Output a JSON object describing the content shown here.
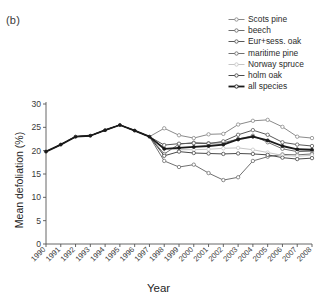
{
  "panel": {
    "label": "(b)"
  },
  "axes": {
    "xlabel": "Year",
    "ylabel": "Mean defoliation (%)"
  },
  "legend": {
    "items": [
      {
        "label": "Scots pine",
        "color": "#8a8a8a",
        "width": 1.0,
        "marker": "circle"
      },
      {
        "label": "beech",
        "color": "#6e6e6e",
        "width": 1.0,
        "marker": "circle"
      },
      {
        "label": "Eur+sess. oak",
        "color": "#595959",
        "width": 1.0,
        "marker": "circle"
      },
      {
        "label": "maritime pine",
        "color": "#707070",
        "width": 1.0,
        "marker": "circle"
      },
      {
        "label": "Norway spruce",
        "color": "#c6c6c6",
        "width": 1.0,
        "marker": "circle"
      },
      {
        "label": "holm oak",
        "color": "#4a4a4a",
        "width": 1.0,
        "marker": "circle"
      },
      {
        "label": "all species",
        "color": "#1a1a1a",
        "width": 1.8,
        "marker": "circle"
      }
    ]
  },
  "chart_data": {
    "type": "line",
    "title": "(b)",
    "xlabel": "Year",
    "ylabel": "Mean defoliation (%)",
    "xlim": [
      1990,
      2008
    ],
    "ylim": [
      0,
      30
    ],
    "yticks": [
      0,
      5,
      10,
      15,
      20,
      25,
      30
    ],
    "xticks": [
      1990,
      1991,
      1992,
      1993,
      1994,
      1995,
      1996,
      1997,
      1998,
      1999,
      2000,
      2001,
      2002,
      2003,
      2004,
      2005,
      2006,
      2007,
      2008
    ],
    "grid": false,
    "legend_position": "top-right",
    "x": [
      1990,
      1991,
      1992,
      1993,
      1994,
      1995,
      1996,
      1997,
      1998,
      1999,
      2000,
      2001,
      2002,
      2003,
      2004,
      2005,
      2006,
      2007,
      2008
    ],
    "series": [
      {
        "name": "Scots pine",
        "color": "#8a8a8a",
        "values": [
          19.8,
          21.3,
          23.0,
          23.2,
          24.4,
          25.5,
          24.3,
          23.0,
          24.8,
          23.3,
          22.7,
          23.5,
          23.6,
          25.6,
          26.4,
          26.6,
          25.1,
          23.0,
          22.7
        ]
      },
      {
        "name": "beech",
        "color": "#6e6e6e",
        "values": [
          19.8,
          21.3,
          23.0,
          23.2,
          24.4,
          25.5,
          24.3,
          23.0,
          19.3,
          21.4,
          21.7,
          21.6,
          21.7,
          22.5,
          23.2,
          21.8,
          20.4,
          19.8,
          19.9
        ]
      },
      {
        "name": "Eur+sess. oak",
        "color": "#595959",
        "values": [
          19.8,
          21.3,
          23.0,
          23.2,
          24.4,
          25.5,
          24.3,
          23.0,
          21.2,
          21.5,
          21.6,
          21.5,
          22.0,
          23.4,
          24.4,
          23.4,
          21.8,
          21.3,
          21.0
        ]
      },
      {
        "name": "maritime pine",
        "color": "#707070",
        "values": [
          19.8,
          21.3,
          23.0,
          23.2,
          24.4,
          25.5,
          24.3,
          23.0,
          17.8,
          16.5,
          17.0,
          15.2,
          13.7,
          14.3,
          17.8,
          18.7,
          19.2,
          19.1,
          19.3
        ]
      },
      {
        "name": "Norway spruce",
        "color": "#c6c6c6",
        "values": [
          19.8,
          21.3,
          23.0,
          23.2,
          24.4,
          25.5,
          24.3,
          23.0,
          20.5,
          20.2,
          20.2,
          20.3,
          20.5,
          20.6,
          20.2,
          19.6,
          19.0,
          18.8,
          19.0
        ]
      },
      {
        "name": "holm oak",
        "color": "#4a4a4a",
        "values": [
          19.8,
          21.3,
          23.0,
          23.2,
          24.4,
          25.5,
          24.3,
          23.0,
          18.9,
          19.8,
          19.5,
          19.4,
          19.3,
          19.4,
          19.3,
          19.1,
          18.5,
          18.2,
          18.4
        ]
      },
      {
        "name": "all species",
        "color": "#1a1a1a",
        "values": [
          19.8,
          21.3,
          23.0,
          23.2,
          24.4,
          25.5,
          24.3,
          23.0,
          20.4,
          20.6,
          20.8,
          21.0,
          21.3,
          22.4,
          23.0,
          22.2,
          21.0,
          20.3,
          20.2
        ]
      }
    ]
  }
}
